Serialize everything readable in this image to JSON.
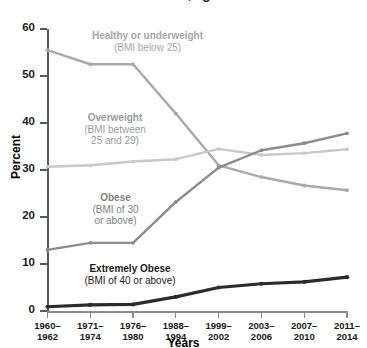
{
  "chart_data": {
    "type": "line",
    "title": "in the United States, aged 20 and over",
    "xlabel": "Years",
    "ylabel": "Percent",
    "ylim": [
      0,
      60
    ],
    "yticks": [
      0,
      10,
      20,
      30,
      40,
      50,
      60
    ],
    "grid": false,
    "legend_position": "inline-annotations",
    "categories": [
      "1960–\n1962",
      "1971–\n1974",
      "1976–\n1980",
      "1988–\n1994",
      "1999–\n2002",
      "2003–\n2006",
      "2007–\n2010",
      "2011–\n2014"
    ],
    "categories_lines": [
      [
        "1960–",
        "1962"
      ],
      [
        "1971–",
        "1974"
      ],
      [
        "1976–",
        "1980"
      ],
      [
        "1988–",
        "1994"
      ],
      [
        "1999–",
        "2002"
      ],
      [
        "2003–",
        "2006"
      ],
      [
        "2007–",
        "2010"
      ],
      [
        "2011–",
        "2014"
      ]
    ],
    "series": [
      {
        "name": "Healthy or underweight",
        "sublabel": "(BMI below 25)",
        "color": "#aaaaaa",
        "values": [
          55.5,
          52.5,
          52.5,
          42.0,
          31.0,
          28.5,
          26.7,
          25.7
        ]
      },
      {
        "name": "Overweight",
        "sublabel": "(BMI between 25 and 29)",
        "color": "#c8c8c8",
        "values": [
          30.7,
          31.0,
          31.8,
          32.3,
          34.5,
          33.2,
          33.6,
          34.4
        ]
      },
      {
        "name": "Obese",
        "sublabel": "(BMI of 30 or above)",
        "color": "#8c8c8c",
        "values": [
          13.0,
          14.5,
          14.5,
          23.2,
          30.5,
          34.2,
          35.7,
          37.8
        ]
      },
      {
        "name": "Extremely Obese",
        "sublabel": "(BMI of 40 or above)",
        "color": "#2b2b2b",
        "values": [
          0.9,
          1.3,
          1.4,
          3.0,
          5.0,
          5.8,
          6.2,
          7.2
        ]
      }
    ]
  },
  "annotations": {
    "healthy": {
      "title": "Healthy or underweight",
      "sub": "(BMI below 25)"
    },
    "overweight": {
      "title": "Overweight",
      "sub1": "(BMI between",
      "sub2": "25 and 29)"
    },
    "obese": {
      "title": "Obese",
      "sub1": "(BMI of 30",
      "sub2": "or above)"
    },
    "extremely": {
      "title": "Extremely Obese",
      "sub": "(BMI of 40 or above)"
    }
  },
  "axes": {
    "y_title": "Percent",
    "x_title": "Years",
    "y_labels": [
      "60",
      "50",
      "40",
      "30",
      "20",
      "10",
      "0"
    ]
  },
  "colors": {
    "axis": "#58595b",
    "text": "#1a1a1a",
    "healthy": "#aaaaaa",
    "overweight": "#c8c8c8",
    "obese": "#8c8c8c",
    "extremely": "#2b2b2b"
  }
}
